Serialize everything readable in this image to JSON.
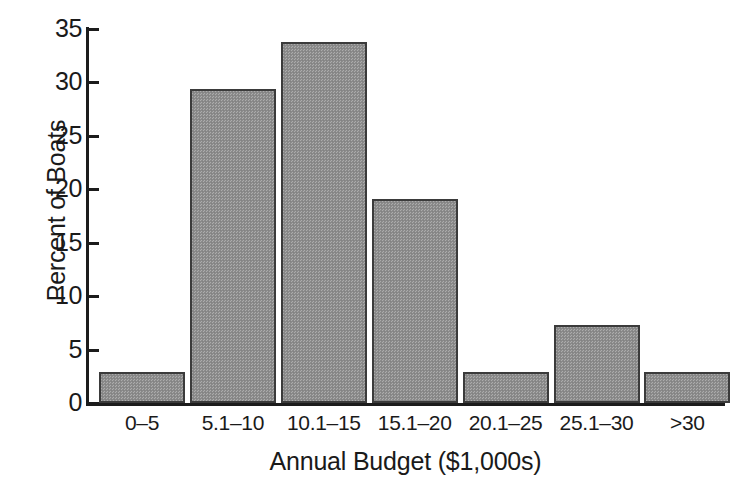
{
  "chart_data": {
    "type": "bar",
    "title": "",
    "xlabel": "Annual Budget ($1,000s)",
    "ylabel": "Percent of Boats",
    "categories": [
      "0–5",
      "5.1–10",
      "10.1–15",
      "15.1–20",
      "20.1–25",
      "25.1–30",
      ">30"
    ],
    "values": [
      2.9,
      29.4,
      33.8,
      19.1,
      2.9,
      7.3,
      2.9
    ],
    "ylim": [
      0,
      35
    ],
    "yticks": [
      0,
      5,
      10,
      15,
      20,
      25,
      30,
      35
    ],
    "ytick_labels": [
      "0",
      "5",
      "10",
      "15",
      "20",
      "25",
      "30",
      "35"
    ],
    "grid": false,
    "legend": null,
    "bar_fill_color": "#8d8d8d",
    "bar_edge_color": "#3b3b3b",
    "axis_color": "#1c1c1c",
    "background_color": "#ffffff"
  }
}
